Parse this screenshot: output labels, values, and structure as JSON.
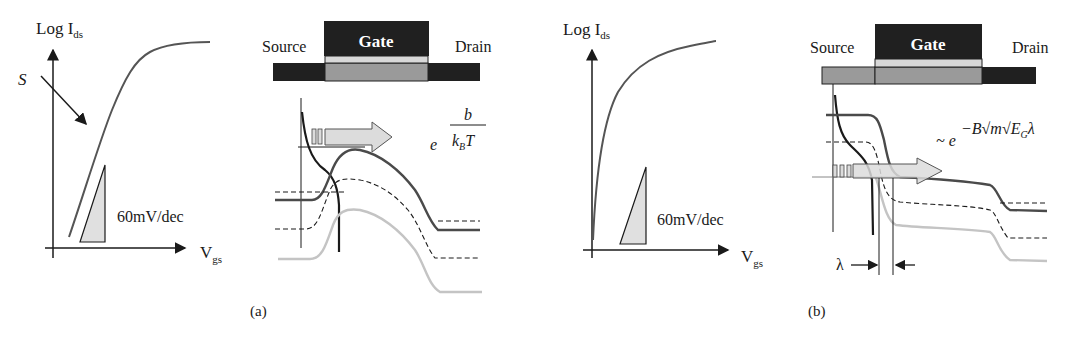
{
  "figure": {
    "panel_a": {
      "caption": "(a)",
      "iv_plot": {
        "y_axis_label": "Log I",
        "y_axis_sub": "ds",
        "x_axis_label": "V",
        "x_axis_sub": "gs",
        "slope_label": "S",
        "triangle_label": "60mV/dec"
      },
      "device": {
        "source_label": "Source",
        "gate_label": "Gate",
        "drain_label": "Drain"
      },
      "formula": {
        "base": "e",
        "numerator": "b",
        "denominator_k": "k",
        "denominator_sub": "B",
        "denominator_T": "T"
      }
    },
    "panel_b": {
      "caption": "(b)",
      "iv_plot": {
        "y_axis_label": "Log I",
        "y_axis_sub": "ds",
        "x_axis_label": "V",
        "x_axis_sub": "gs",
        "triangle_label": "60mV/dec"
      },
      "device": {
        "source_label": "Source",
        "gate_label": "Gate",
        "drain_label": "Drain"
      },
      "formula": {
        "prefix": "~ e",
        "exponent_text": "−B√m√E",
        "exponent_sub": "G",
        "exponent_tail": "λ"
      },
      "tunnel_width_label": "λ"
    },
    "colors": {
      "dark": "#1f1f1f",
      "gate_dark": "#202020",
      "oxide": "#d8d8d8",
      "channel_gray": "#9a9a9a",
      "curve_dark": "#3a3a3a",
      "curve_light": "#c4c4c4",
      "arrow_fill": "#dcdcdc"
    }
  }
}
